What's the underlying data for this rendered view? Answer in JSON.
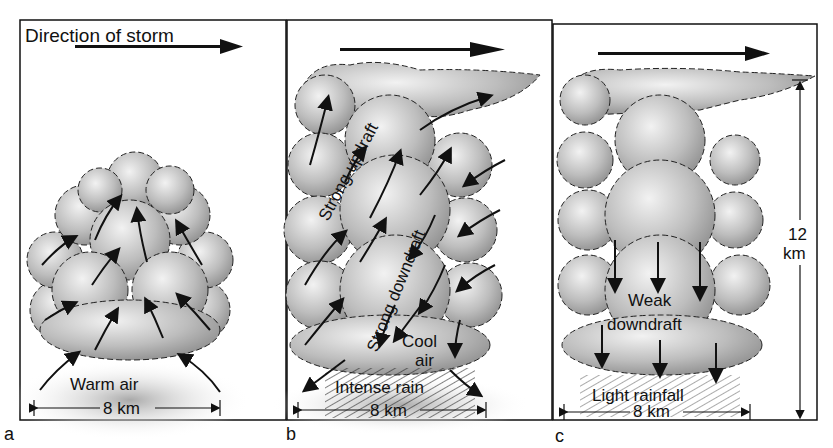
{
  "figure": {
    "title": "Direction of storm",
    "panels": [
      {
        "id": "a",
        "stage": "cumulus",
        "labels": {
          "bottom": "Warm air",
          "width": "8 km"
        }
      },
      {
        "id": "b",
        "stage": "mature",
        "labels": {
          "updraft": "Strong updraft",
          "downdraft": "Strong downdraft",
          "cool_air_1": "Cool",
          "cool_air_2": "air",
          "rain": "Intense rain",
          "width": "8 km"
        }
      },
      {
        "id": "c",
        "stage": "dissipating",
        "labels": {
          "downdraft_1": "Weak",
          "downdraft_2": "downdraft",
          "rain": "Light rainfall",
          "width": "8 km",
          "height_1": "12",
          "height_2": "km"
        }
      }
    ]
  },
  "colors": {
    "ink": "#111111",
    "cloud_light": "#e8e8e8",
    "cloud_dark": "#9a9a9a",
    "ground_shadow": "#b5b5b5"
  }
}
